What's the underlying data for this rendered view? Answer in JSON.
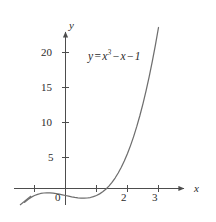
{
  "chart_data": {
    "type": "line",
    "title": "",
    "annotation": "y = x^3 - x - 1",
    "annotation_parts": {
      "lhs": "y",
      "equals": "=",
      "var": "x",
      "exponent": "3",
      "minus1": "−",
      "term2": "x",
      "minus2": "−",
      "constant": "1"
    },
    "xlabel": "x",
    "ylabel": "y",
    "xlim": [
      -1.45,
      3.55
    ],
    "ylim": [
      -3.2,
      23.5
    ],
    "grid": false,
    "legend": null,
    "x_ticks": [
      -1,
      1,
      2,
      3
    ],
    "x_tick_labels": [
      "-1",
      "",
      "2",
      "3"
    ],
    "y_ticks": [
      5,
      10,
      15,
      20
    ],
    "y_tick_labels": [
      "5",
      "10",
      "15",
      "20"
    ],
    "origin_label": "0",
    "curve_color": "#6e6e6e",
    "axis_color": "#4d4d4d",
    "text_color": "#2b2b2b",
    "series": [
      {
        "name": "y = x^3 - x - 1",
        "x": [
          -1.32,
          -1.2,
          -1.1,
          -1.0,
          -0.9,
          -0.8,
          -0.7,
          -0.6,
          -0.5,
          -0.4,
          -0.3,
          -0.2,
          -0.1,
          0.0,
          0.1,
          0.2,
          0.3,
          0.4,
          0.5,
          0.6,
          0.7,
          0.8,
          0.9,
          1.0,
          1.1,
          1.2,
          1.3,
          1.4,
          1.5,
          1.6,
          1.7,
          1.8,
          1.9,
          2.0,
          2.1,
          2.2,
          2.3,
          2.4,
          2.5,
          2.6,
          2.7,
          2.8,
          2.9,
          3.0
        ],
        "y": [
          -1.98,
          -1.528,
          -1.231,
          -1.0,
          -0.829,
          -0.712,
          -0.643,
          -0.616,
          -0.625,
          -0.664,
          -0.727,
          -0.808,
          -0.901,
          -1.0,
          -1.099,
          -1.192,
          -1.273,
          -1.336,
          -1.375,
          -1.384,
          -1.357,
          -1.288,
          -1.171,
          -1.0,
          -0.769,
          -0.472,
          -0.103,
          0.344,
          0.875,
          1.496,
          2.213,
          3.032,
          3.959,
          5.0,
          6.161,
          7.448,
          8.867,
          10.424,
          12.125,
          13.976,
          15.983,
          18.152,
          20.489,
          23.0
        ]
      }
    ],
    "roots": [
      1.3247
    ],
    "local_max": {
      "x": -0.5774,
      "y": -0.6151
    },
    "local_min": {
      "x": 0.5774,
      "y": -1.3849
    }
  },
  "axes": {
    "x_axis_name": "x",
    "y_axis_name": "y",
    "origin_label": "0"
  },
  "ticks": {
    "y": [
      {
        "value": 20,
        "label": "20"
      },
      {
        "value": 15,
        "label": "15"
      },
      {
        "value": 10,
        "label": "10"
      },
      {
        "value": 5,
        "label": "5"
      }
    ],
    "x": [
      {
        "value": -1,
        "label": "-1"
      },
      {
        "value": 1,
        "label": ""
      },
      {
        "value": 2,
        "label": "2"
      },
      {
        "value": 3,
        "label": "3"
      }
    ]
  }
}
